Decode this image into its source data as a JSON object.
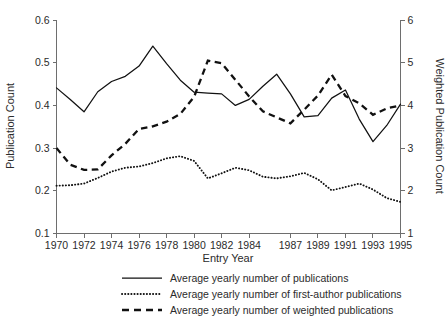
{
  "chart_data": {
    "type": "line",
    "title": "",
    "xlabel": "Entry Year",
    "ylabel": "Publication Count",
    "ylabel_secondary": "Weighted Publication Count",
    "grid": false,
    "legend_position": "bottom",
    "x": [
      1970,
      1971,
      1972,
      1973,
      1974,
      1975,
      1976,
      1977,
      1978,
      1979,
      1980,
      1981,
      1982,
      1983,
      1984,
      1985,
      1986,
      1987,
      1988,
      1989,
      1990,
      1991,
      1992,
      1993,
      1994,
      1995
    ],
    "xtick_labels": [
      "1970",
      "1972",
      "1974",
      "1976",
      "1978",
      "1980",
      "1982",
      "1984",
      "1987",
      "1989",
      "1991",
      "1993",
      "1995"
    ],
    "xtick_values": [
      1970,
      1972,
      1974,
      1976,
      1978,
      1980,
      1982,
      1984,
      1987,
      1989,
      1991,
      1993,
      1995
    ],
    "xlim": [
      1970,
      1995
    ],
    "ylim": [
      0.1,
      0.6
    ],
    "ytick_labels": [
      "0.1",
      "0.2",
      "0.3",
      "0.4",
      "0.5",
      "0.6"
    ],
    "ytick_values": [
      0.1,
      0.2,
      0.3,
      0.4,
      0.5,
      0.6
    ],
    "ylim_secondary": [
      1,
      6
    ],
    "ytick_labels_secondary": [
      "1",
      "2",
      "3",
      "4",
      "5",
      "6"
    ],
    "ytick_values_secondary": [
      1,
      2,
      3,
      4,
      5,
      6
    ],
    "series": [
      {
        "name": "Average yearly number of publications",
        "style": "solid",
        "axis": "left",
        "values": [
          0.441,
          0.414,
          0.385,
          0.432,
          0.456,
          0.468,
          0.492,
          0.539,
          0.498,
          0.459,
          0.431,
          0.429,
          0.427,
          0.4,
          0.414,
          0.445,
          0.473,
          0.427,
          0.373,
          0.376,
          0.417,
          0.436,
          0.368,
          0.315,
          0.353,
          0.403
        ]
      },
      {
        "name": "Average yearly number of first-author publications",
        "style": "dotted",
        "axis": "left",
        "values": [
          0.212,
          0.213,
          0.217,
          0.23,
          0.245,
          0.254,
          0.257,
          0.265,
          0.276,
          0.281,
          0.27,
          0.229,
          0.241,
          0.254,
          0.248,
          0.233,
          0.229,
          0.234,
          0.242,
          0.227,
          0.201,
          0.209,
          0.217,
          0.203,
          0.183,
          0.174
        ]
      },
      {
        "name": "Average yearly number of weighted publications",
        "style": "dashed",
        "axis": "right",
        "values": [
          3.0,
          2.61,
          2.49,
          2.5,
          2.83,
          3.1,
          3.45,
          3.51,
          3.62,
          3.8,
          4.2,
          5.05,
          4.99,
          4.6,
          4.21,
          3.86,
          3.72,
          3.58,
          3.9,
          4.23,
          4.72,
          4.22,
          4.05,
          3.78,
          3.93,
          4.0
        ]
      }
    ]
  },
  "legend": {
    "items": [
      {
        "label": "Average yearly number of publications",
        "style": "solid"
      },
      {
        "label": "Average yearly number of first-author publications",
        "style": "dotted"
      },
      {
        "label": "Average yearly number of weighted publications",
        "style": "dashed"
      }
    ]
  },
  "axes": {
    "left_title": "Publication Count",
    "right_title": "Weighted Publication Count",
    "bottom_title": "Entry Year"
  }
}
